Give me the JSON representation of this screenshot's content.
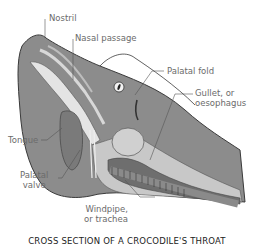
{
  "diagram": {
    "caption": "CROSS SECTION OF A CROCODILE'S THROAT",
    "labels": {
      "nostril": "Nostril",
      "nasal_passage": "Nasal passage",
      "palatal_fold": "Palatal fold",
      "gullet_line1": "Gullet, or",
      "gullet_line2": "oesophagus",
      "tongue": "Tongue",
      "palatal_valve_line1": "Palatal",
      "palatal_valve_line2": "valve",
      "windpipe_line1": "Windpipe,",
      "windpipe_line2": "or trachea"
    },
    "colors": {
      "skin": "#8c8c8c",
      "tissue_light": "#c8c8c8",
      "tissue_dark": "#6e6e6e",
      "passage": "#e4e4e4",
      "leader": "#555555",
      "text": "#6b6b6b"
    }
  }
}
